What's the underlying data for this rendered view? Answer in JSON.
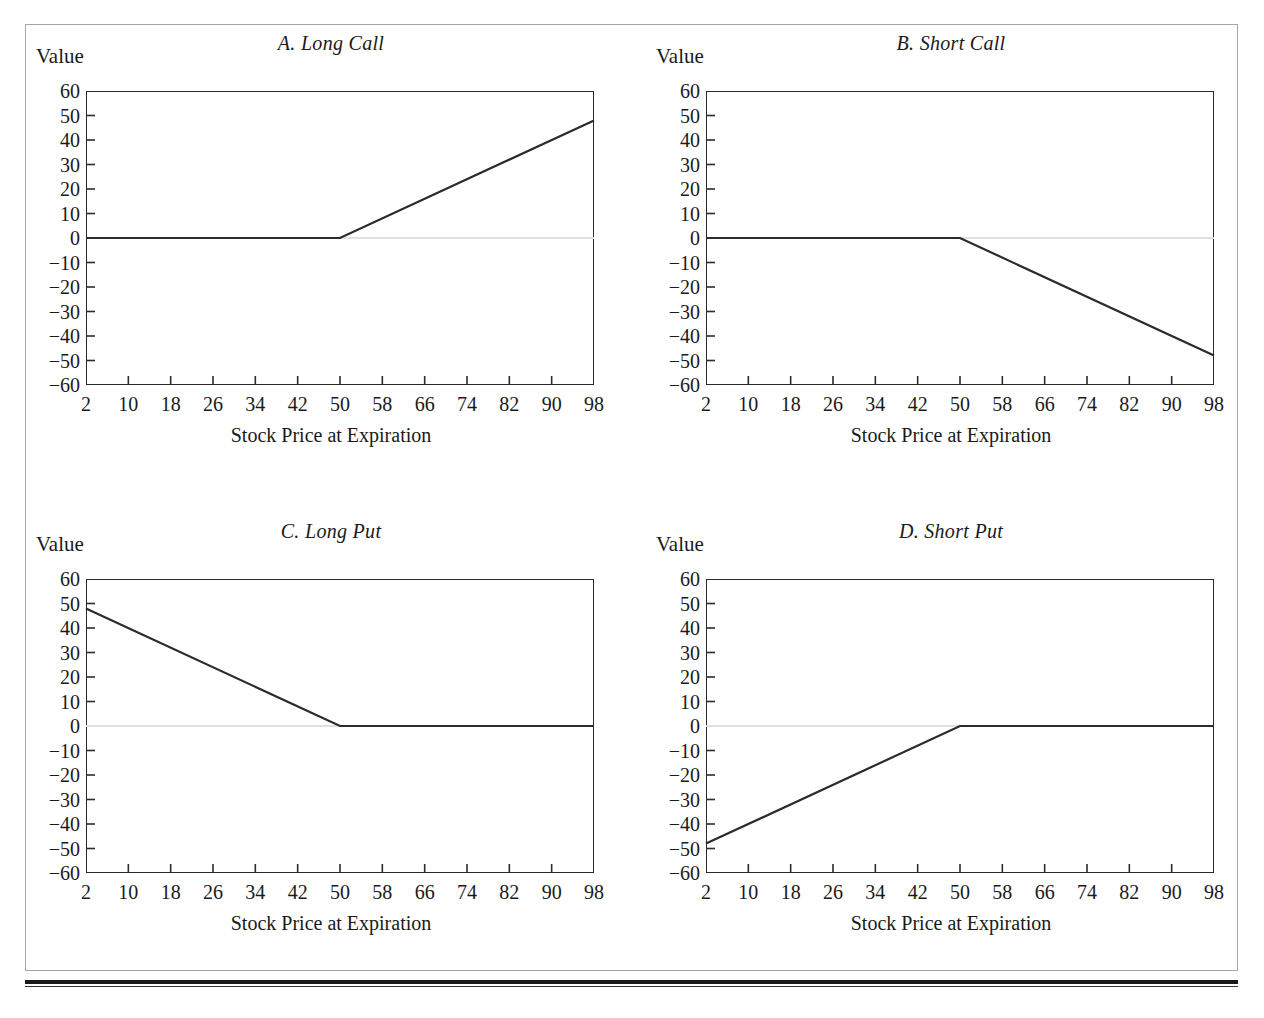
{
  "figure": {
    "ghost_top_text": "· ·   ·     ·       ·         ·           ·",
    "frame_color": "#a6a6a6",
    "rule_color": "#1a1a1a"
  },
  "common": {
    "ylabel": "Value",
    "xlabel": "Stock Price at Expiration",
    "x_ticks": [
      2,
      10,
      18,
      26,
      34,
      42,
      50,
      58,
      66,
      74,
      82,
      90,
      98
    ],
    "y_ticks": [
      60,
      50,
      40,
      30,
      20,
      10,
      0,
      "−10",
      "−20",
      "−30",
      "−40",
      "−50",
      "−60"
    ],
    "line_color": "#2b2b2b",
    "zero_line_color": "#e0e0e0"
  },
  "chart_data": [
    {
      "type": "line",
      "panel": "A",
      "title": "A. Long Call",
      "xlabel": "Stock Price at Expiration",
      "ylabel": "Value",
      "xlim": [
        2,
        98
      ],
      "ylim": [
        -60,
        60
      ],
      "xticks": [
        2,
        10,
        18,
        26,
        34,
        42,
        50,
        58,
        66,
        74,
        82,
        90,
        98
      ],
      "yticks": [
        -60,
        -50,
        -40,
        -30,
        -20,
        -10,
        0,
        10,
        20,
        30,
        40,
        50,
        60
      ],
      "grid": false,
      "legend": "none",
      "strike": 50,
      "series": [
        {
          "name": "Long Call payoff",
          "x": [
            2,
            50,
            98
          ],
          "values": [
            0,
            0,
            48
          ]
        }
      ]
    },
    {
      "type": "line",
      "panel": "B",
      "title": "B. Short Call",
      "xlabel": "Stock Price at Expiration",
      "ylabel": "Value",
      "xlim": [
        2,
        98
      ],
      "ylim": [
        -60,
        60
      ],
      "xticks": [
        2,
        10,
        18,
        26,
        34,
        42,
        50,
        58,
        66,
        74,
        82,
        90,
        98
      ],
      "yticks": [
        -60,
        -50,
        -40,
        -30,
        -20,
        -10,
        0,
        10,
        20,
        30,
        40,
        50,
        60
      ],
      "grid": false,
      "legend": "none",
      "strike": 50,
      "series": [
        {
          "name": "Short Call payoff",
          "x": [
            2,
            50,
            98
          ],
          "values": [
            0,
            0,
            -48
          ]
        }
      ]
    },
    {
      "type": "line",
      "panel": "C",
      "title": "C. Long Put",
      "xlabel": "Stock Price at Expiration",
      "ylabel": "Value",
      "xlim": [
        2,
        98
      ],
      "ylim": [
        -60,
        60
      ],
      "xticks": [
        2,
        10,
        18,
        26,
        34,
        42,
        50,
        58,
        66,
        74,
        82,
        90,
        98
      ],
      "yticks": [
        -60,
        -50,
        -40,
        -30,
        -20,
        -10,
        0,
        10,
        20,
        30,
        40,
        50,
        60
      ],
      "grid": false,
      "legend": "none",
      "strike": 50,
      "series": [
        {
          "name": "Long Put payoff",
          "x": [
            2,
            50,
            98
          ],
          "values": [
            48,
            0,
            0
          ]
        }
      ]
    },
    {
      "type": "line",
      "panel": "D",
      "title": "D. Short Put",
      "xlabel": "Stock Price at Expiration",
      "ylabel": "Value",
      "xlim": [
        2,
        98
      ],
      "ylim": [
        -60,
        60
      ],
      "xticks": [
        2,
        10,
        18,
        26,
        34,
        42,
        50,
        58,
        66,
        74,
        82,
        90,
        98
      ],
      "yticks": [
        -60,
        -50,
        -40,
        -30,
        -20,
        -10,
        0,
        10,
        20,
        30,
        40,
        50,
        60
      ],
      "grid": false,
      "legend": "none",
      "strike": 50,
      "series": [
        {
          "name": "Short Put payoff",
          "x": [
            2,
            50,
            98
          ],
          "values": [
            -48,
            0,
            0
          ]
        }
      ]
    }
  ]
}
